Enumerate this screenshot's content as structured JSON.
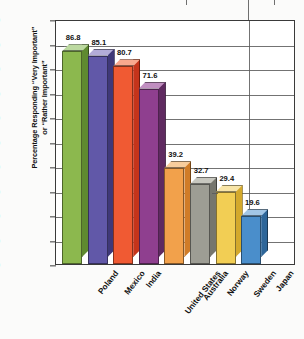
{
  "chart_data": {
    "type": "bar",
    "title": "",
    "xlabel": "",
    "ylabel": "Percentage Responding “Very Important” or “Rather Important”",
    "ylabel_line1": "Percentage Responding “Very Important”",
    "ylabel_line2": "or “Rather Important”",
    "ylim": [
      0,
      100
    ],
    "ytick_step": 10,
    "yticks": [
      "0",
      "10",
      "20",
      "30",
      "40",
      "50",
      "60",
      "70",
      "80",
      "90",
      "100"
    ],
    "grid": true,
    "legend": "none",
    "categories": [
      "Poland",
      "Mexico",
      "India",
      "United States",
      "Australia",
      "Norway",
      "Sweden",
      "Japan"
    ],
    "values": [
      86.8,
      85.1,
      80.7,
      71.6,
      39.2,
      32.7,
      29.4,
      19.6
    ],
    "value_labels": [
      "86.8",
      "85.1",
      "80.7",
      "71.6",
      "39.2",
      "32.7",
      "29.4",
      "19.6"
    ],
    "colors": [
      "#8cb84e",
      "#6158a8",
      "#f05a33",
      "#8f3f8f",
      "#f2a14b",
      "#9d9d94",
      "#f2ce54",
      "#4a8ecb"
    ],
    "side_colors": [
      "#5f8a30",
      "#3f3878",
      "#c5341b",
      "#5f2a60",
      "#d07c27",
      "#76766d",
      "#d4a92c",
      "#2e6699"
    ],
    "top_colors": [
      "#bcd9a0",
      "#b3acd8",
      "#f8a88e",
      "#c08ec0",
      "#f8cd9c",
      "#c7c7bf",
      "#f8e5a8",
      "#a2c6e6"
    ]
  }
}
